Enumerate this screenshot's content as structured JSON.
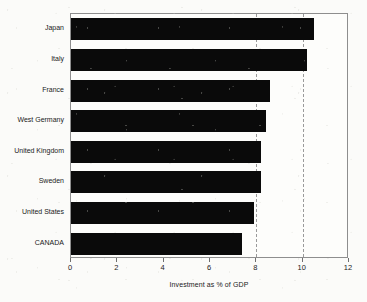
{
  "chart_data": {
    "type": "bar",
    "orientation": "horizontal",
    "title": "",
    "xlabel": "Investment as % of GDP",
    "ylabel": "",
    "categories": [
      "Japan",
      "Italy",
      "France",
      "West Germany",
      "United Kingdom",
      "Sweden",
      "United States",
      "CANADA"
    ],
    "values": [
      10.5,
      10.2,
      8.6,
      8.4,
      8.2,
      8.2,
      7.9,
      7.4
    ],
    "xlim": [
      0,
      12
    ],
    "xticks": [
      0,
      2,
      4,
      6,
      8,
      10,
      12
    ],
    "xtick_labels": [
      "0",
      "2",
      "4",
      "6",
      "8",
      "10",
      "12"
    ],
    "grid": "vertical-dashed",
    "gridlines": [
      8,
      10
    ],
    "legend": "none",
    "bar_color": "#0a0a0a",
    "background_color": "#fbfbf9",
    "frame_color": "#8e8e8e"
  }
}
